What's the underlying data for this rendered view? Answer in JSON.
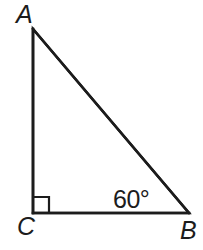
{
  "figure": {
    "kind": "right-triangle-diagram",
    "background_color": "#ffffff",
    "stroke_color": "#1c1c1c",
    "stroke_width": 2.6,
    "width": 203,
    "height": 250,
    "vertices": {
      "A": {
        "label": "A",
        "x": 33,
        "y": 29
      },
      "B": {
        "label": "B",
        "x": 189,
        "y": 213
      },
      "C": {
        "label": "C",
        "x": 33,
        "y": 213
      }
    },
    "sides": [
      {
        "name": "AC",
        "from": "A",
        "to": "C",
        "label": ""
      },
      {
        "name": "CB",
        "from": "C",
        "to": "B",
        "label": ""
      },
      {
        "name": "AB",
        "from": "A",
        "to": "B",
        "label": ""
      }
    ],
    "angles": [
      {
        "at": "C",
        "label": "",
        "measure": "90",
        "marker": "right-angle-square"
      },
      {
        "at": "B",
        "label": "60°",
        "measure": "60",
        "marker": "none"
      }
    ],
    "right_angle_marker": {
      "at": "C",
      "size": 16,
      "x": 33,
      "y": 197
    }
  }
}
